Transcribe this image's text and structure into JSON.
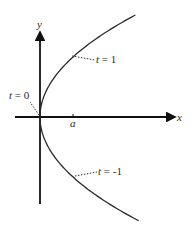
{
  "figure": {
    "type": "parametric-parabola",
    "equation": "x = a t^2, y = 2 a t",
    "axes": {
      "x_label": "x",
      "y_label": "y",
      "x_tick_label": "a"
    },
    "annotations": [
      {
        "id": "t0",
        "text": "t = 0",
        "t": 0
      },
      {
        "id": "t1",
        "text": "t = 1",
        "t": 1
      },
      {
        "id": "tm1",
        "text": "t = -1",
        "t": -1
      }
    ],
    "colors": {
      "curve": "#2a2a2a",
      "axes": "#111111",
      "text": "#2a2a2a"
    }
  }
}
